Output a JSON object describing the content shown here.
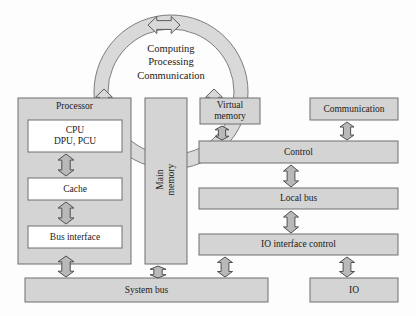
{
  "diagram": {
    "colors": {
      "fill_gray": "#d4d4d4",
      "fill_white": "#ffffff",
      "stroke": "#6f6f6f",
      "arrow_fill": "#b9b9b9",
      "arrow_stroke": "#4f4f4f",
      "ring_fill": "#d9d9d9",
      "text": "#1b1b1b",
      "page_bg": "#fdfdfd"
    },
    "ring": {
      "name": "computing-ring",
      "lines": [
        "Computing",
        "Processing",
        "Communication"
      ],
      "cx": 171,
      "cy": 92,
      "outer_r": 77,
      "inner_r": 63
    },
    "groups": [
      {
        "name": "processor-group",
        "label": "Processor",
        "x": 18,
        "y": 98,
        "w": 113,
        "h": 166
      }
    ],
    "boxes": [
      {
        "name": "cpu-box",
        "label": "CPU\nDPU, PCU",
        "x": 28,
        "y": 120,
        "w": 94,
        "h": 32,
        "fill": "white",
        "rotated": false
      },
      {
        "name": "cache-box",
        "label": "Cache",
        "x": 28,
        "y": 178,
        "w": 94,
        "h": 22,
        "fill": "white",
        "rotated": false
      },
      {
        "name": "bus-interface-box",
        "label": "Bus interface",
        "x": 28,
        "y": 226,
        "w": 94,
        "h": 22,
        "fill": "white",
        "rotated": false
      },
      {
        "name": "main-memory-box",
        "label": "Main\nmemory",
        "x": 145,
        "y": 98,
        "w": 42,
        "h": 166,
        "fill": "gray",
        "rotated": true
      },
      {
        "name": "virtual-memory-box",
        "label": "Virtual\nmemory",
        "x": 200,
        "y": 98,
        "w": 60,
        "h": 26,
        "fill": "gray",
        "rotated": false
      },
      {
        "name": "communication-box",
        "label": "Communication",
        "x": 310,
        "y": 98,
        "w": 88,
        "h": 22,
        "fill": "gray",
        "rotated": false
      },
      {
        "name": "control-bar",
        "label": "Control",
        "x": 199,
        "y": 141,
        "w": 199,
        "h": 22,
        "fill": "gray",
        "rotated": false
      },
      {
        "name": "local-bus-bar",
        "label": "Local bus",
        "x": 199,
        "y": 188,
        "w": 199,
        "h": 21,
        "fill": "gray",
        "rotated": false
      },
      {
        "name": "io-interface-control-bar",
        "label": "IO interface control",
        "x": 199,
        "y": 234,
        "w": 199,
        "h": 21,
        "fill": "gray",
        "rotated": false
      },
      {
        "name": "system-bus-bar",
        "label": "System bus",
        "x": 25,
        "y": 278,
        "w": 243,
        "h": 24,
        "fill": "gray",
        "rotated": false
      },
      {
        "name": "io-box",
        "label": "IO",
        "x": 310,
        "y": 278,
        "w": 88,
        "h": 24,
        "fill": "gray",
        "rotated": false
      }
    ],
    "arrows": [
      {
        "name": "arrow-cpu-cache",
        "x": 66,
        "y": 154,
        "len": 22,
        "w": 16,
        "dir": "vertical"
      },
      {
        "name": "arrow-cache-bus-interface",
        "x": 66,
        "y": 202,
        "len": 22,
        "w": 16,
        "dir": "vertical"
      },
      {
        "name": "arrow-bus-interface-system-bus",
        "x": 66,
        "y": 256,
        "len": 21,
        "w": 16,
        "dir": "vertical"
      },
      {
        "name": "arrow-main-memory-system-bus",
        "x": 158,
        "y": 266,
        "len": 12,
        "w": 16,
        "dir": "vertical"
      },
      {
        "name": "arrow-virtual-memory-control",
        "x": 222,
        "y": 126,
        "len": 14,
        "w": 14,
        "dir": "vertical"
      },
      {
        "name": "arrow-communication-control",
        "x": 347,
        "y": 122,
        "len": 18,
        "w": 14,
        "dir": "vertical"
      },
      {
        "name": "arrow-control-local-bus",
        "x": 291,
        "y": 165,
        "len": 22,
        "w": 15,
        "dir": "vertical"
      },
      {
        "name": "arrow-local-bus-io-interface",
        "x": 291,
        "y": 211,
        "len": 22,
        "w": 15,
        "dir": "vertical"
      },
      {
        "name": "arrow-io-interface-system-bus",
        "x": 225,
        "y": 257,
        "len": 20,
        "w": 15,
        "dir": "vertical"
      },
      {
        "name": "arrow-io-interface-io",
        "x": 347,
        "y": 257,
        "len": 20,
        "w": 15,
        "dir": "vertical"
      }
    ],
    "ring_arrows": [
      {
        "name": "ring-arrow-top",
        "cx": 164,
        "cy": 25,
        "len": 32,
        "w": 17,
        "dir": "horizontal"
      },
      {
        "name": "ring-arrow-left",
        "cx": 104,
        "cy": 104,
        "len": 30,
        "w": 17,
        "dir": "vertical"
      },
      {
        "name": "ring-arrow-right",
        "cx": 214,
        "cy": 104,
        "len": 30,
        "w": 17,
        "dir": "vertical"
      },
      {
        "name": "ring-arrow-bottom",
        "cx": 166,
        "cy": 160,
        "len": 32,
        "w": 17,
        "dir": "horizontal"
      }
    ]
  }
}
